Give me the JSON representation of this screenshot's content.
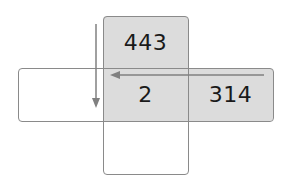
{
  "diagram": {
    "cells": {
      "top": "443",
      "center": "2",
      "right": "314",
      "left": "",
      "bottom": ""
    },
    "arrows": [
      {
        "name": "vertical-arrow",
        "direction": "down"
      },
      {
        "name": "horizontal-arrow",
        "direction": "left"
      }
    ],
    "colors": {
      "shaded": "#dcdcdc",
      "border": "#8a8a8a",
      "arrow": "#808080"
    }
  }
}
